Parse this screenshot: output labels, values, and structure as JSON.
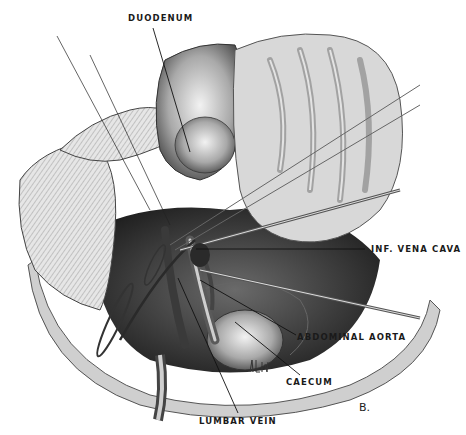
{
  "figure": {
    "panel_letter": "B.",
    "signature": "artist-signature",
    "labels": [
      {
        "id": "duodenum",
        "text": "DUODENUM"
      },
      {
        "id": "inf-vena-cava",
        "text": "INF. VENA CAVA"
      },
      {
        "id": "abdominal-aorta",
        "text": "ABDOMINAL AORTA"
      },
      {
        "id": "caecum",
        "text": "CAECUM"
      },
      {
        "id": "lumbar-vein",
        "text": "LUMBAR VEIN"
      }
    ]
  }
}
